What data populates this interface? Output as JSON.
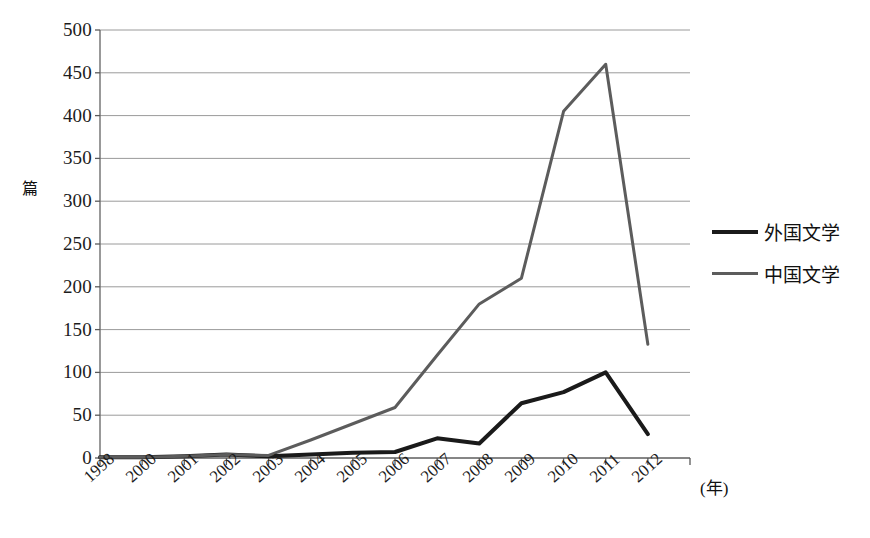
{
  "chart_data": {
    "type": "line",
    "title": "",
    "xlabel": "(年)",
    "ylabel": "篇",
    "ylim": [
      0,
      500
    ],
    "ytick_step": 50,
    "yticks": [
      0,
      50,
      100,
      150,
      200,
      250,
      300,
      350,
      400,
      450,
      500
    ],
    "grid": true,
    "legend_position": "right",
    "categories": [
      "1998",
      "2000",
      "2001",
      "2002",
      "2003",
      "2004",
      "2005",
      "2006",
      "2007",
      "2008",
      "2009",
      "2010",
      "2011",
      "2012"
    ],
    "series": [
      {
        "name": "外国文学",
        "color": "#1a1a1a",
        "width": 4,
        "values": [
          1,
          1,
          2,
          4,
          2,
          4,
          6,
          7,
          23,
          17,
          64,
          77,
          100,
          28
        ]
      },
      {
        "name": "中国文学",
        "color": "#5c5c5c",
        "width": 3,
        "values": [
          1,
          1,
          2,
          4,
          3,
          21,
          40,
          59,
          120,
          180,
          210,
          405,
          460,
          133
        ]
      }
    ]
  },
  "axis": {
    "y_unit": "篇",
    "x_unit": "(年)"
  },
  "legend": {
    "items": [
      {
        "label": "外国文学",
        "color": "#1a1a1a",
        "width": 4
      },
      {
        "label": "中国文学",
        "color": "#5c5c5c",
        "width": 3
      }
    ]
  }
}
